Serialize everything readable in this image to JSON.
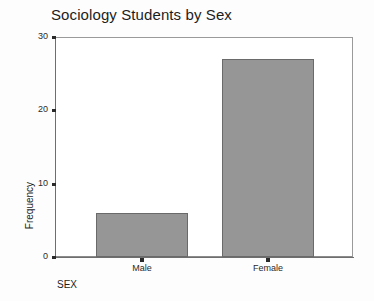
{
  "chart_data": {
    "type": "bar",
    "title": "Sociology Students by Sex",
    "xlabel": "SEX",
    "ylabel": "Frequency",
    "categories": [
      "Male",
      "Female"
    ],
    "values": [
      6,
      27
    ],
    "ylim": [
      0,
      30
    ],
    "y_ticks": [
      0,
      10,
      20,
      30
    ],
    "y_tick_labels": [
      "0",
      "10",
      "20",
      "30"
    ],
    "grid": false,
    "legend": "none",
    "bar_color": "#969696",
    "bar_border_color": "#6a6a6a",
    "axis_color": "#6e6e6e",
    "text_color": "#1d1d1d",
    "background": "#ffffff",
    "series": [
      {
        "name": "Frequency",
        "values": [
          6,
          27
        ]
      }
    ]
  },
  "chart": {
    "title": "Sociology Students by Sex",
    "y_axis": {
      "title": "Frequency",
      "ticks": [
        {
          "label": "30",
          "value": 30
        },
        {
          "label": "20",
          "value": 20
        },
        {
          "label": "10",
          "value": 10
        },
        {
          "label": "0",
          "value": 0
        }
      ]
    },
    "x_axis": {
      "title": "SEX",
      "ticks": [
        {
          "label": "Male",
          "value": 6
        },
        {
          "label": "Female",
          "value": 27
        }
      ]
    },
    "bars": [
      {
        "label": "Male",
        "value": 6
      },
      {
        "label": "Female",
        "value": 27
      }
    ]
  }
}
